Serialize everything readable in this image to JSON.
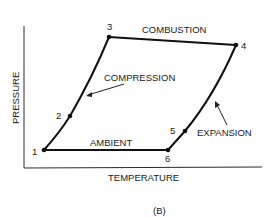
{
  "diagram": {
    "caption": "(B)",
    "axes": {
      "x_label": "TEMPERATURE",
      "y_label": "PRESSURE"
    },
    "points": [
      {
        "id": "1",
        "label": "1"
      },
      {
        "id": "2",
        "label": "2"
      },
      {
        "id": "3",
        "label": "3"
      },
      {
        "id": "4",
        "label": "4"
      },
      {
        "id": "5",
        "label": "5"
      },
      {
        "id": "6",
        "label": "6"
      }
    ],
    "processes": {
      "compression": "COMPRESSION",
      "combustion": "COMBUSTION",
      "expansion": "EXPANSION",
      "ambient": "AMBIENT"
    }
  }
}
